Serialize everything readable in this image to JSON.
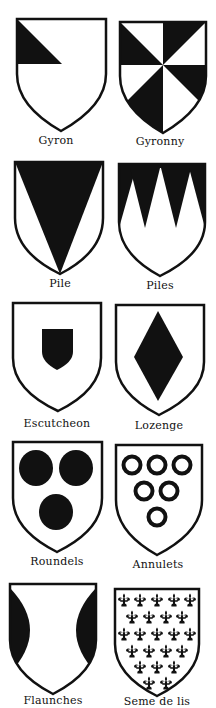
{
  "colors": {
    "ink": "#111111",
    "field": "#ffffff"
  },
  "charges": [
    {
      "id": "gyron",
      "label": "Gyron",
      "label_pos": [
        56,
        136
      ]
    },
    {
      "id": "gyronny",
      "label": "Gyronny",
      "label_pos": [
        160,
        137
      ]
    },
    {
      "id": "pile",
      "label": "Pile",
      "label_pos": [
        60,
        279
      ]
    },
    {
      "id": "piles",
      "label": "Piles",
      "label_pos": [
        160,
        281
      ]
    },
    {
      "id": "escutcheon",
      "label": "Escutcheon",
      "label_pos": [
        57,
        419
      ]
    },
    {
      "id": "lozenge",
      "label": "Lozenge",
      "label_pos": [
        159,
        421
      ]
    },
    {
      "id": "roundels",
      "label": "Roundels",
      "label_pos": [
        57,
        557
      ]
    },
    {
      "id": "annulets",
      "label": "Annulets",
      "label_pos": [
        158,
        560
      ]
    },
    {
      "id": "flaunches",
      "label": "Flaunches",
      "label_pos": [
        53,
        696
      ]
    },
    {
      "id": "seme-de-lis",
      "label": "Seme de lis",
      "label_pos": [
        157,
        697
      ]
    }
  ],
  "seme_rows": [
    5,
    4,
    5,
    4,
    3,
    2
  ]
}
